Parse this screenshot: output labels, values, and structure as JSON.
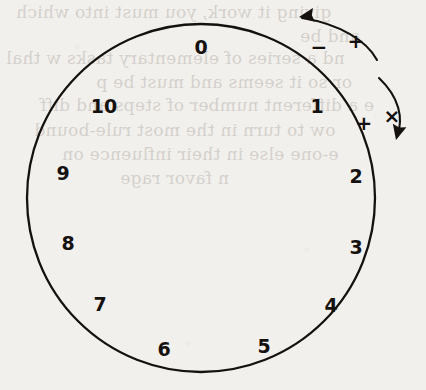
{
  "figure": {
    "name": "operator-dial-diagram",
    "background_color": "#f2f0ec",
    "ink_color": "#14110f",
    "circle": {
      "center_x": 201,
      "center_y": 198,
      "radius": 174,
      "stroke_width": 2.3
    },
    "dial_labels": [
      {
        "text": "0",
        "x": 201,
        "y": 48,
        "angle_deg": 0
      },
      {
        "text": "1",
        "x": 317,
        "y": 107,
        "angle_deg": 33
      },
      {
        "text": "2",
        "x": 356,
        "y": 177,
        "angle_deg": 65
      },
      {
        "text": "3",
        "x": 356,
        "y": 248,
        "angle_deg": 98
      },
      {
        "text": "4",
        "x": 331,
        "y": 306,
        "angle_deg": 131
      },
      {
        "text": "5",
        "x": 264,
        "y": 347,
        "angle_deg": 164
      },
      {
        "text": "6",
        "x": 164,
        "y": 350,
        "angle_deg": 196
      },
      {
        "text": "7",
        "x": 100,
        "y": 305,
        "angle_deg": 229
      },
      {
        "text": "8",
        "x": 68,
        "y": 244,
        "angle_deg": 262
      },
      {
        "text": "9",
        "x": 63,
        "y": 174,
        "angle_deg": 295
      },
      {
        "text": "10",
        "x": 104,
        "y": 107,
        "angle_deg": 328
      }
    ],
    "arrows": [
      {
        "name": "decrement-arrow",
        "direction": "counterclockwise",
        "points_to": "lower numbers",
        "path": "M 377 60 C 367 41, 340 24, 302 18",
        "arrowhead_x": 299,
        "arrowhead_y": 17,
        "arrowhead_rotation_deg": -188,
        "labels": [
          {
            "text": "−",
            "x": 319,
            "y": 48
          },
          {
            "text": "+",
            "x": 356,
            "y": 42
          }
        ]
      },
      {
        "name": "increment-arrow",
        "direction": "clockwise",
        "points_to": "higher numbers",
        "path": "M 379 78 C 399 97, 404 118, 397 137",
        "arrowhead_x": 396,
        "arrowhead_y": 140,
        "arrowhead_rotation_deg": 104,
        "labels": [
          {
            "text": "+",
            "x": 364,
            "y": 124
          },
          {
            "text": "×",
            "x": 392,
            "y": 117
          }
        ]
      }
    ],
    "bleed_through_lines": [
      {
        "text": "giving it work, you must into which",
        "x": 16,
        "y": 2
      },
      {
        "text": "and be",
        "x": 300,
        "y": 26
      },
      {
        "text": "nd a series of elementary tasks w  thal",
        "x": 6,
        "y": 48
      },
      {
        "text": "or so it seems and must be p",
        "x": 96,
        "y": 72
      },
      {
        "text": "e a different number of steps and diff",
        "x": 40,
        "y": 95
      },
      {
        "text": "ow to turn in the most rule-bound",
        "x": 34,
        "y": 120
      },
      {
        "text": "e-one else in their influence on",
        "x": 62,
        "y": 144
      },
      {
        "text": "n favor rage",
        "x": 120,
        "y": 168
      }
    ]
  }
}
